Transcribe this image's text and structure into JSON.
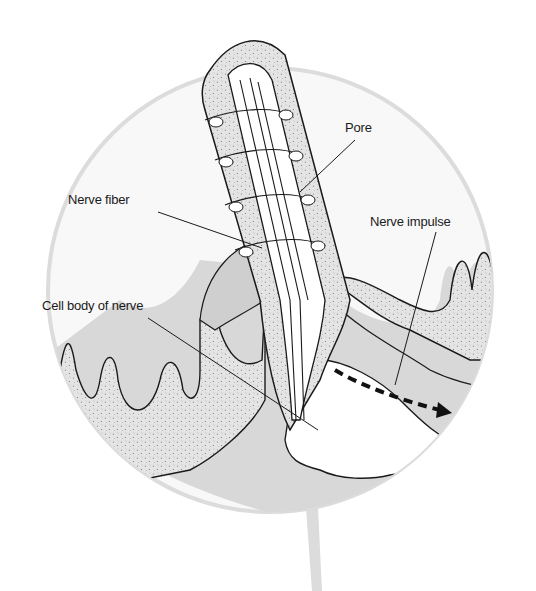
{
  "diagram": {
    "title": "",
    "colors": {
      "background": "#ffffff",
      "circle_fill": "#f7f7f7",
      "circle_edge": "#d8d8d8",
      "tissue_fill": "#d9d9d9",
      "stipple_fill": "#e2e2e2",
      "line": "#1a1a1a"
    },
    "labels": {
      "pore": "Pore",
      "nerve_fiber": "Nerve fiber",
      "nerve_impulse": "Nerve impulse",
      "cell_body": "Cell body of nerve"
    }
  }
}
